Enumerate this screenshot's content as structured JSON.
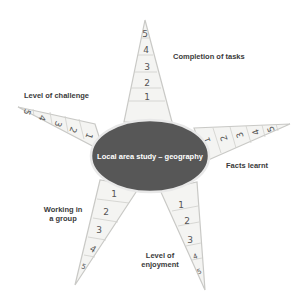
{
  "diagram": {
    "center": {
      "label": "Local area study – geography",
      "color": "#575757"
    },
    "arms": [
      {
        "id": "top",
        "label": "Completion of tasks",
        "scale": [
          "1",
          "2",
          "3",
          "4",
          "5"
        ]
      },
      {
        "id": "left",
        "label": "Level of challenge",
        "scale": [
          "1",
          "2",
          "3",
          "4",
          "5"
        ]
      },
      {
        "id": "right",
        "label": "Facts learnt",
        "scale": [
          "1",
          "2",
          "3",
          "4",
          "5"
        ]
      },
      {
        "id": "lower-left",
        "label_line1": "Working in",
        "label_line2": "a group",
        "scale": [
          "1",
          "2",
          "3",
          "4",
          "5"
        ]
      },
      {
        "id": "lower-right",
        "label_line1": "Level of",
        "label_line2": "enjoyment",
        "scale": [
          "1",
          "2",
          "3",
          "4",
          "5"
        ]
      }
    ]
  }
}
